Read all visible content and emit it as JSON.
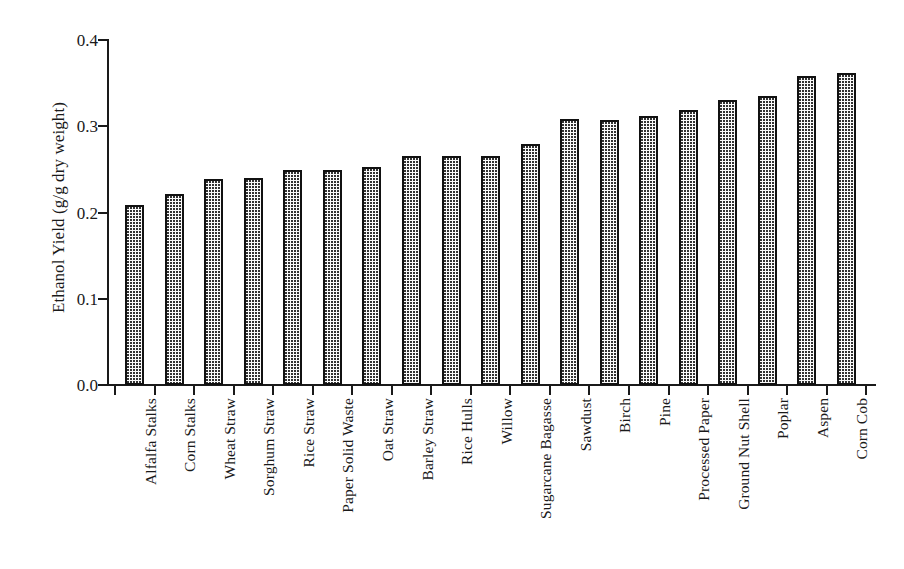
{
  "chart_data": {
    "type": "bar",
    "title": "",
    "xlabel": "",
    "ylabel": "Ethanol Yield (g/g dry weight)",
    "ylim": [
      0.0,
      0.4
    ],
    "yticks": [
      "0.0",
      "0.1",
      "0.2",
      "0.3",
      "0.4"
    ],
    "ytick_values": [
      0.0,
      0.1,
      0.2,
      0.3,
      0.4
    ],
    "grid": false,
    "legend": "none",
    "orientation": "vertical",
    "bar_fill": "dotted-stipple",
    "bar_edge_color": "#111111",
    "bar_face_color": "#fbfbfb",
    "categories": [
      "Alfalfa Stalks",
      "Corn Stalks",
      "Wheat Straw",
      "Sorghum Straw",
      "Rice Straw",
      "Paper Solid Waste",
      "Oat Straw",
      "Barley Straw",
      "Rice Hulls",
      "Willow",
      "Sugarcane Bagasse",
      "Sawdust",
      "Birch",
      "Pine",
      "Processed Paper",
      "Ground Nut Shell",
      "Poplar",
      "Aspen",
      "Corn Cob"
    ],
    "values": [
      0.209,
      0.221,
      0.239,
      0.24,
      0.249,
      0.249,
      0.253,
      0.266,
      0.266,
      0.266,
      0.28,
      0.308,
      0.307,
      0.312,
      0.319,
      0.33,
      0.335,
      0.358,
      0.362
    ]
  }
}
